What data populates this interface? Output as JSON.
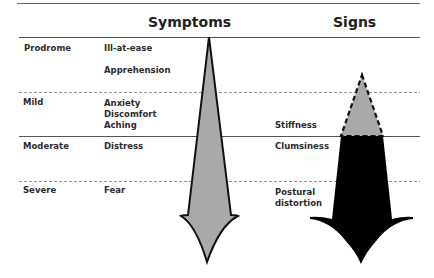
{
  "headers": {
    "symptoms": "Symptoms",
    "signs": "Signs"
  },
  "stages": [
    {
      "label": "Prodrome",
      "symptoms": [
        "Ill-at-ease",
        "Apprehension"
      ],
      "signs": []
    },
    {
      "label": "Mild",
      "symptoms": [
        "Anxiety",
        "Discomfort",
        "Aching"
      ],
      "signs": [
        "Stiffness"
      ]
    },
    {
      "label": "Moderate",
      "symptoms": [
        "Distress"
      ],
      "signs": [
        "Clumsiness"
      ]
    },
    {
      "label": "Severe",
      "symptoms": [
        "Fear"
      ],
      "signs": [
        "Postural",
        "distortion"
      ]
    }
  ],
  "colors": {
    "symptom_arrow_fill": "#a9a9a9",
    "signs_arrow_upper_fill": "#a9a9a9",
    "signs_arrow_lower_fill": "#000000",
    "rule": "#555555"
  }
}
